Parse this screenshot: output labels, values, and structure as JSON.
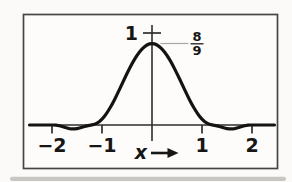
{
  "figure": {
    "background": "#fbfaf8",
    "frame_color": "#454545",
    "axis_color": "#2e2e2e",
    "curve_color": "#131313",
    "leader_color": "#a9a7a3",
    "x_axis_label": "x",
    "x_axis_arrow": "right-arrow",
    "y_tick_label": "1",
    "peak_fraction": {
      "numerator": "8",
      "denominator": "9"
    }
  },
  "chart_data": {
    "type": "line",
    "title": "",
    "xlabel": "x",
    "ylabel": "",
    "xlim": [
      -2.45,
      2.45
    ],
    "ylim": [
      -0.12,
      1.08
    ],
    "grid": false,
    "legend": false,
    "x_ticks": [
      {
        "value": -2,
        "label": "−2"
      },
      {
        "value": -1,
        "label": "−1"
      },
      {
        "value": 1,
        "label": "1"
      },
      {
        "value": 2,
        "label": "2"
      }
    ],
    "y_ticks": [
      {
        "value": 1,
        "label": "1"
      }
    ],
    "annotations": [
      {
        "text": "8/9",
        "value": 0.889,
        "at_x": 0,
        "note": "peak height of curve"
      }
    ],
    "series": [
      {
        "name": "bell-shaped curve with small negative side lobes, peak 8/9 at x=0",
        "points": [
          [
            -2.45,
            0
          ],
          [
            -2.3,
            0
          ],
          [
            -2.15,
            0
          ],
          [
            -2.0,
            0
          ],
          [
            -1.95,
            0
          ],
          [
            -1.9,
            -0.002
          ],
          [
            -1.8,
            -0.016
          ],
          [
            -1.7,
            -0.034
          ],
          [
            -1.6,
            -0.044
          ],
          [
            -1.5,
            -0.041
          ],
          [
            -1.4,
            -0.025
          ],
          [
            -1.3,
            -0.007
          ],
          [
            -1.2,
            0
          ],
          [
            -1.1,
            0.015
          ],
          [
            -1.0,
            0.06
          ],
          [
            -0.9,
            0.13
          ],
          [
            -0.8,
            0.222
          ],
          [
            -0.7,
            0.329
          ],
          [
            -0.6,
            0.445
          ],
          [
            -0.5,
            0.56
          ],
          [
            -0.4,
            0.667
          ],
          [
            -0.3,
            0.759
          ],
          [
            -0.2,
            0.829
          ],
          [
            -0.1,
            0.874
          ],
          [
            0,
            0.889
          ],
          [
            0.1,
            0.874
          ],
          [
            0.2,
            0.829
          ],
          [
            0.3,
            0.759
          ],
          [
            0.4,
            0.667
          ],
          [
            0.5,
            0.56
          ],
          [
            0.6,
            0.445
          ],
          [
            0.7,
            0.329
          ],
          [
            0.8,
            0.222
          ],
          [
            0.9,
            0.13
          ],
          [
            1.0,
            0.06
          ],
          [
            1.1,
            0.015
          ],
          [
            1.2,
            0
          ],
          [
            1.3,
            -0.007
          ],
          [
            1.4,
            -0.025
          ],
          [
            1.5,
            -0.041
          ],
          [
            1.6,
            -0.044
          ],
          [
            1.7,
            -0.034
          ],
          [
            1.8,
            -0.016
          ],
          [
            1.9,
            -0.002
          ],
          [
            1.95,
            0
          ],
          [
            2.0,
            0
          ],
          [
            2.15,
            0
          ],
          [
            2.3,
            0
          ],
          [
            2.45,
            0
          ]
        ]
      }
    ]
  }
}
